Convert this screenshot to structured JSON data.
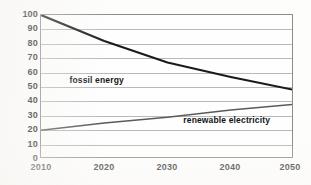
{
  "chart_data": {
    "type": "line",
    "title": "",
    "xlabel": "",
    "ylabel": "",
    "x": [
      2010,
      2020,
      2030,
      2040,
      2050
    ],
    "xlim": [
      2010,
      2050
    ],
    "ylim": [
      0,
      100
    ],
    "y_ticks": [
      0,
      10,
      20,
      30,
      40,
      50,
      60,
      70,
      80,
      90,
      100
    ],
    "x_ticks": [
      2010,
      2020,
      2030,
      2040,
      2050
    ],
    "grid": "horizontal",
    "legend": "inline-labels",
    "series": [
      {
        "name": "fossil energy",
        "values": [
          100,
          82,
          67,
          57,
          48
        ],
        "color": "#1a1a1a",
        "width": 2.1,
        "label_x": 2014.5,
        "label_y": 55
      },
      {
        "name": "renewable electricity",
        "values": [
          20,
          25,
          29,
          34,
          38
        ],
        "color": "#5a5a5a",
        "width": 1.4,
        "label_x": 2032.5,
        "label_y": 27
      }
    ]
  },
  "axes": {
    "y_tick_labels": [
      "100",
      "90",
      "80",
      "70",
      "60",
      "50",
      "40",
      "30",
      "20",
      "10",
      "0"
    ],
    "x_tick_labels": [
      "2010",
      "2020",
      "2030",
      "2040",
      "2050"
    ]
  },
  "labels": {
    "fossil": "fossil energy",
    "renewable": "renewable electricity"
  }
}
